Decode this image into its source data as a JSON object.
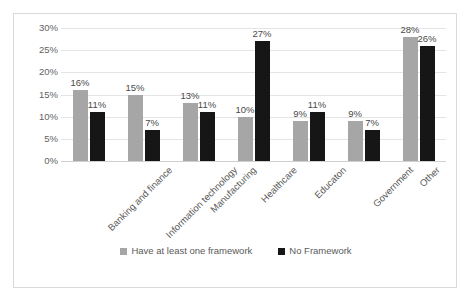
{
  "chart_data": {
    "type": "bar",
    "title": "",
    "subtitle": "",
    "xlabel": "",
    "ylabel": "",
    "ylim": [
      0,
      30
    ],
    "ytick_labels": [
      "30%",
      "25%",
      "20%",
      "15%",
      "10%",
      "5%",
      "0%"
    ],
    "ytick_values": [
      30,
      25,
      20,
      15,
      10,
      5,
      0
    ],
    "grid": true,
    "legend_position": "bottom",
    "categories": [
      "Banking and finance",
      "Information technology",
      "Manufacturing",
      "Healthcare",
      "Educaton",
      "Government",
      "Other"
    ],
    "series": [
      {
        "name": "Have at least one framework",
        "color": "#a6a6a6",
        "values": [
          16,
          15,
          13,
          10,
          9,
          9,
          28
        ],
        "value_labels": [
          "16%",
          "15%",
          "13%",
          "10%",
          "9%",
          "9%",
          "28%"
        ]
      },
      {
        "name": "No Framework",
        "color": "#161616",
        "values": [
          11,
          7,
          11,
          27,
          11,
          7,
          26
        ],
        "value_labels": [
          "11%",
          "7%",
          "11%",
          "27%",
          "11%",
          "7%",
          "26%"
        ]
      }
    ]
  },
  "legend": {
    "items": [
      {
        "label": "Have at least one framework",
        "color": "#a6a6a6"
      },
      {
        "label": "No Framework",
        "color": "#161616"
      }
    ]
  },
  "colors": {
    "series_a": "#a6a6a6",
    "series_b": "#161616",
    "gridline": "#e4e4e4",
    "border": "#d9d9d9",
    "text": "#5a5a5a",
    "background": "#ffffff"
  }
}
